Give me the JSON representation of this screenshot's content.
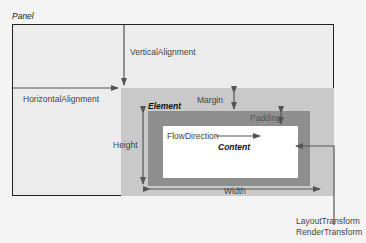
{
  "diagram": {
    "panel_label": "Panel",
    "vertical_alignment_label": "VerticalAlignment",
    "horizontal_alignment_label": "HorizontalAlignment",
    "element_label": "Element",
    "margin_label": "Margin",
    "padding_label": "Padding",
    "height_label": "Height",
    "width_label": "Width",
    "flow_direction_label": "FlowDirection",
    "content_label": "Content",
    "layout_transform_label": "LayoutTransform",
    "render_transform_label": "RenderTransform"
  },
  "colors": {
    "panel_fill": "#ececec",
    "margin_fill": "#c9c9c9",
    "padding_fill": "#8e8e8e",
    "content_fill": "#ffffff",
    "arrow": "#555555",
    "border": "#222222"
  }
}
